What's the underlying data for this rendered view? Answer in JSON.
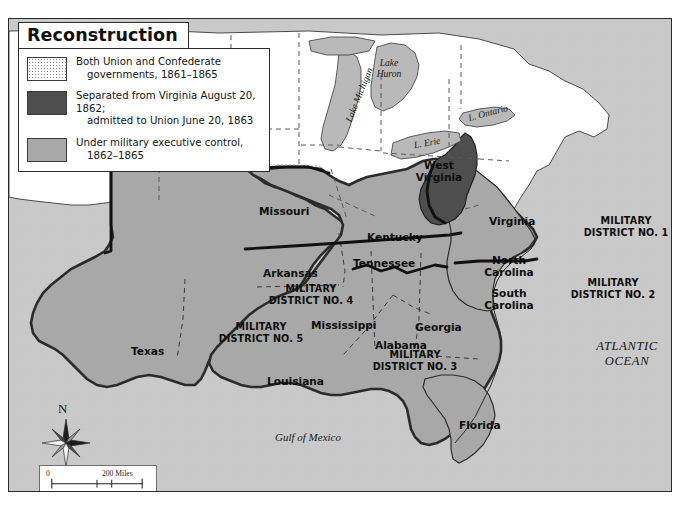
{
  "map": {
    "title": "Reconstruction",
    "legend": {
      "items": [
        {
          "swatch": "stipple",
          "line1": "Both Union and Confederate",
          "line2": "governments, 1861–1865"
        },
        {
          "swatch": "dark",
          "line1": "Separated from Virginia August 20, 1862;",
          "line2": "admitted to Union June 20, 1863"
        },
        {
          "swatch": "mid",
          "line1": "Under military executive control,",
          "line2": "1862–1865"
        }
      ]
    },
    "states": [
      {
        "name": "Missouri",
        "shading": "stipple"
      },
      {
        "name": "Kentucky",
        "shading": "stipple"
      },
      {
        "name": "West Virginia",
        "shading": "dark"
      },
      {
        "name": "Virginia",
        "shading": "mid"
      },
      {
        "name": "North Carolina",
        "shading": "mid"
      },
      {
        "name": "South Carolina",
        "shading": "mid"
      },
      {
        "name": "Georgia",
        "shading": "mid"
      },
      {
        "name": "Florida",
        "shading": "mid"
      },
      {
        "name": "Alabama",
        "shading": "mid"
      },
      {
        "name": "Mississippi",
        "shading": "mid"
      },
      {
        "name": "Tennessee",
        "shading": "mid"
      },
      {
        "name": "Arkansas",
        "shading": "mid"
      },
      {
        "name": "Louisiana",
        "shading": "mid"
      },
      {
        "name": "Texas",
        "shading": "mid"
      }
    ],
    "districts": [
      {
        "id": 1,
        "line1": "MILITARY",
        "line2": "DISTRICT NO. 1"
      },
      {
        "id": 2,
        "line1": "MILITARY",
        "line2": "DISTRICT NO. 2"
      },
      {
        "id": 3,
        "line1": "MILITARY",
        "line2": "DISTRICT NO. 3"
      },
      {
        "id": 4,
        "line1": "MILITARY",
        "line2": "DISTRICT NO. 4"
      },
      {
        "id": 5,
        "line1": "MILITARY",
        "line2": "DISTRICT NO. 5"
      }
    ],
    "water": {
      "atlantic_line1": "ATLANTIC",
      "atlantic_line2": "OCEAN",
      "gulf": "Gulf of Mexico",
      "lake_michigan": "Lake Michigan",
      "lake_huron_l1": "Lake",
      "lake_huron_l2": "Huron",
      "lake_erie": "L. Erie",
      "lake_ontario": "L. Ontario"
    },
    "compass": {
      "north": "N"
    },
    "scale": {
      "miles_zero": "0",
      "miles_label": "200 Miles",
      "kms_zero": "0",
      "kms_label": "200 Kms"
    },
    "colors": {
      "dark_shade": "#4e4e4e",
      "mid_shade": "#a8a8a8",
      "stipple_bg": "#fbfbfb",
      "water": "#c9c9c9",
      "land_unshaded": "#ffffff",
      "outline": "#2b2b2b"
    }
  }
}
